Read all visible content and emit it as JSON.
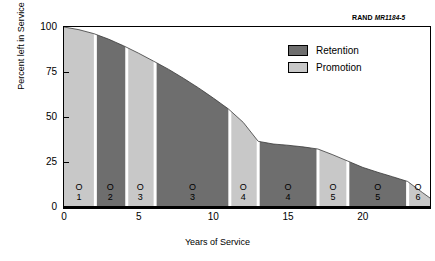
{
  "source": {
    "org": "RAND",
    "document": "MR1184-5"
  },
  "chart_data": {
    "type": "area",
    "title": "",
    "xlabel": "Years of Service",
    "ylabel": "Percent left in Service",
    "xlim": [
      0,
      24.5
    ],
    "ylim": [
      0,
      100
    ],
    "xticks": [
      0,
      5,
      10,
      15,
      20
    ],
    "yticks": [
      0,
      25,
      50,
      75,
      100
    ],
    "grid": false,
    "legend_position": "upper-right",
    "colors": {
      "retention": "#6e6e6e",
      "promotion": "#c8c8c8",
      "separator": "#ffffff",
      "axis": "#000000"
    },
    "legend": [
      {
        "name": "Retention",
        "color": "#6e6e6e"
      },
      {
        "name": "Promotion",
        "color": "#c8c8c8"
      }
    ],
    "series": [
      {
        "name": "Percent left in Service",
        "x": [
          0,
          1,
          2,
          3,
          4,
          5,
          6,
          7,
          8,
          9,
          10,
          11,
          12,
          13,
          14,
          15,
          16,
          17,
          18,
          19,
          20,
          21,
          22,
          23,
          24,
          24.5
        ],
        "values": [
          100,
          98.5,
          96.3,
          93.2,
          89.5,
          85.4,
          81.0,
          76.5,
          71.5,
          66.2,
          60.5,
          54.5,
          47.0,
          36.5,
          35.0,
          34.3,
          33.4,
          32.2,
          29.0,
          25.5,
          22.0,
          19.3,
          16.8,
          14.2,
          8.0,
          5.0
        ]
      }
    ],
    "bands": [
      {
        "label_letter": "O",
        "label_number": "1",
        "grade": "O-1",
        "type": "promotion",
        "x_start": 0,
        "x_end": 2.0,
        "x_center": 1.0
      },
      {
        "label_letter": "O",
        "label_number": "2",
        "grade": "O-2",
        "type": "retention",
        "x_start": 2.2,
        "x_end": 4.1,
        "x_center": 3.1
      },
      {
        "label_letter": "O",
        "label_number": "3",
        "grade": "O-3",
        "type": "promotion",
        "x_start": 4.3,
        "x_end": 6.0,
        "x_center": 5.1
      },
      {
        "label_letter": "O",
        "label_number": "3",
        "grade": "O-3",
        "type": "retention",
        "x_start": 6.2,
        "x_end": 11.0,
        "x_center": 8.6
      },
      {
        "label_letter": "O",
        "label_number": "4",
        "grade": "O-4",
        "type": "promotion",
        "x_start": 11.2,
        "x_end": 12.9,
        "x_center": 12.0
      },
      {
        "label_letter": "O",
        "label_number": "4",
        "grade": "O-4",
        "type": "retention",
        "x_start": 13.1,
        "x_end": 16.9,
        "x_center": 15.0
      },
      {
        "label_letter": "O",
        "label_number": "5",
        "grade": "O-5",
        "type": "promotion",
        "x_start": 17.1,
        "x_end": 18.9,
        "x_center": 18.0
      },
      {
        "label_letter": "O",
        "label_number": "5",
        "grade": "O-5",
        "type": "retention",
        "x_start": 19.1,
        "x_end": 22.9,
        "x_center": 21.0
      },
      {
        "label_letter": "O",
        "label_number": "6",
        "grade": "O-6",
        "type": "promotion",
        "x_start": 23.1,
        "x_end": 24.5,
        "x_center": 23.7
      }
    ]
  }
}
